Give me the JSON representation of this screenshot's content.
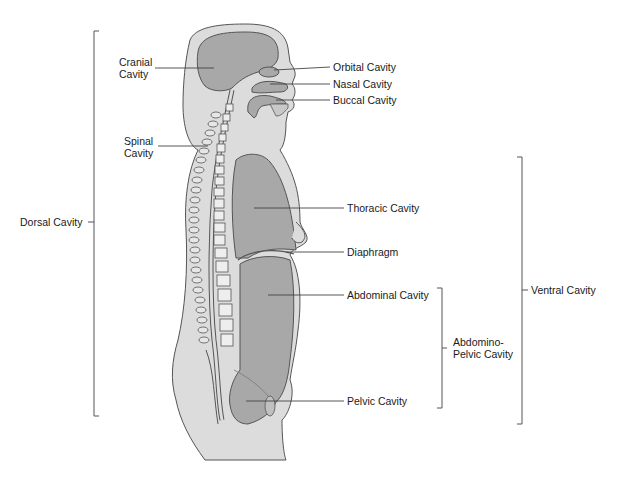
{
  "figure": {
    "colors": {
      "body_fill": "#dcdcdc",
      "cavity_fill": "#a8a8a8",
      "outline": "#555555",
      "leader_line": "#444444",
      "text": "#1a1a1a",
      "background": "#ffffff"
    }
  },
  "labels": {
    "cranial": "Cranial\nCavity",
    "spinal": "Spinal\nCavity",
    "orbital": "Orbital Cavity",
    "nasal": "Nasal Cavity",
    "buccal": "Buccal Cavity",
    "thoracic": "Thoracic Cavity",
    "diaphragm": "Diaphragm",
    "abdominal": "Abdominal Cavity",
    "pelvic": "Pelvic Cavity",
    "abdomino_pelvic": "Abdomino-\nPelvic Cavity",
    "dorsal": "Dorsal Cavity",
    "ventral": "Ventral Cavity"
  },
  "brackets": [
    {
      "name": "dorsal",
      "x": 94,
      "y_top": 31,
      "y_bottom": 416
    },
    {
      "name": "ventral",
      "x": 522,
      "y_top": 157,
      "y_bottom": 424
    },
    {
      "name": "abdomino-pelvic",
      "x": 442,
      "y_top": 288,
      "y_bottom": 408
    }
  ]
}
